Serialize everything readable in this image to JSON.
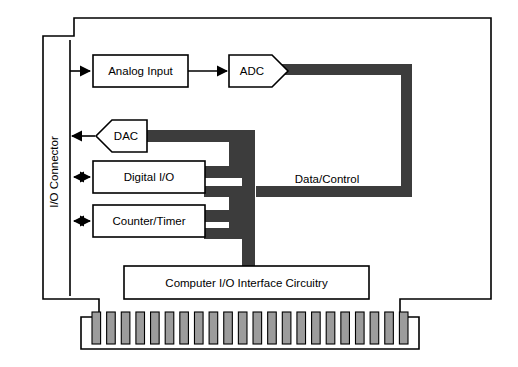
{
  "diagram": {
    "colors": {
      "bus": "#3c3c3c",
      "finger_fill": "#9c9c9c",
      "board_stroke": "#000000",
      "box_fill": "#ffffff",
      "background": "#ffffff"
    },
    "connector": {
      "label": "I/O Connector",
      "orientation": "vertical-bottom-to-top"
    },
    "bus": {
      "label": "Data/Control",
      "name": "data-control-bus"
    },
    "blocks": [
      {
        "id": "analog-input",
        "label": "Analog Input",
        "shape": "rectangle"
      },
      {
        "id": "adc",
        "label": "ADC",
        "shape": "pentagon-right"
      },
      {
        "id": "dac",
        "label": "DAC",
        "shape": "pentagon-left"
      },
      {
        "id": "digital-io",
        "label": "Digital I/O",
        "shape": "rectangle"
      },
      {
        "id": "counter-timer",
        "label": "Counter/Timer",
        "shape": "rectangle"
      },
      {
        "id": "computer-io",
        "label": "Computer I/O Interface Circuitry",
        "shape": "rectangle"
      }
    ],
    "signal_arrows": [
      {
        "id": "analog-in-arrow",
        "from": "I/O Connector",
        "to": "Analog Input",
        "direction": "right"
      },
      {
        "id": "analog-adc-arrow",
        "from": "Analog Input",
        "to": "ADC",
        "direction": "right"
      },
      {
        "id": "dac-out-arrow",
        "from": "DAC",
        "to": "I/O Connector",
        "direction": "left"
      },
      {
        "id": "digital-io-arrow",
        "from": "I/O Connector",
        "to": "Digital I/O",
        "direction": "both"
      },
      {
        "id": "counter-timer-arrow",
        "from": "I/O Connector",
        "to": "Counter/Timer",
        "direction": "both"
      }
    ],
    "edge_connector": {
      "name": "card-edge-connector",
      "finger_count": 22
    }
  }
}
